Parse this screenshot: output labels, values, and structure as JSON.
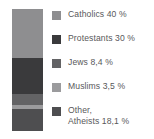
{
  "chart_data": {
    "type": "bar",
    "subtype": "stacked-bar-100",
    "title": "",
    "xlabel": "",
    "ylabel": "",
    "orientation": "vertical",
    "grid": false,
    "legend_position": "right",
    "categories": [
      "Catholics",
      "Protestants",
      "Jews",
      "Muslims",
      "Other, Atheists"
    ],
    "values": [
      40,
      30,
      8.4,
      3.5,
      18.1
    ],
    "value_labels": [
      "40 %",
      "30 %",
      "8,4 %",
      "3,5 %",
      "18,1 %"
    ],
    "ylim": [
      0,
      100
    ],
    "series": [
      {
        "name": "Share of population",
        "values": [
          40,
          30,
          8.4,
          3.5,
          18.1
        ]
      }
    ]
  },
  "legend": {
    "items": [
      {
        "name": "catholics",
        "label": "Catholics 40 %",
        "line1": "Catholics 40 %",
        "line2": "",
        "color": "#8e8e90",
        "value": 40
      },
      {
        "name": "protestants",
        "label": "Protestants 30 %",
        "line1": "Protestants 30 %",
        "line2": "",
        "color": "#3a3a3c",
        "value": 30
      },
      {
        "name": "jews",
        "label": "Jews 8,4 %",
        "line1": "Jews 8,4 %",
        "line2": "",
        "color": "#636365",
        "value": 8.4
      },
      {
        "name": "muslims",
        "label": "Muslims 3,5 %",
        "line1": "Muslims 3,5 %",
        "line2": "",
        "color": "#9b9b9d",
        "value": 3.5
      },
      {
        "name": "other-atheists",
        "label": "Other, Atheists 18,1 %",
        "line1": "Other,",
        "line2": "Atheists 18,1 %",
        "value": 18.1,
        "color": "#4e4e50"
      }
    ]
  },
  "bar": {
    "segments": [
      {
        "name": "catholics",
        "color": "#8e8e90",
        "percent": 40
      },
      {
        "name": "protestants",
        "color": "#3a3a3c",
        "percent": 30
      },
      {
        "name": "jews",
        "color": "#636365",
        "percent": 8.4
      },
      {
        "name": "muslims",
        "color": "#9b9b9d",
        "percent": 3.5
      },
      {
        "name": "other-atheists",
        "color": "#4e4e50",
        "percent": 18.1
      }
    ]
  }
}
